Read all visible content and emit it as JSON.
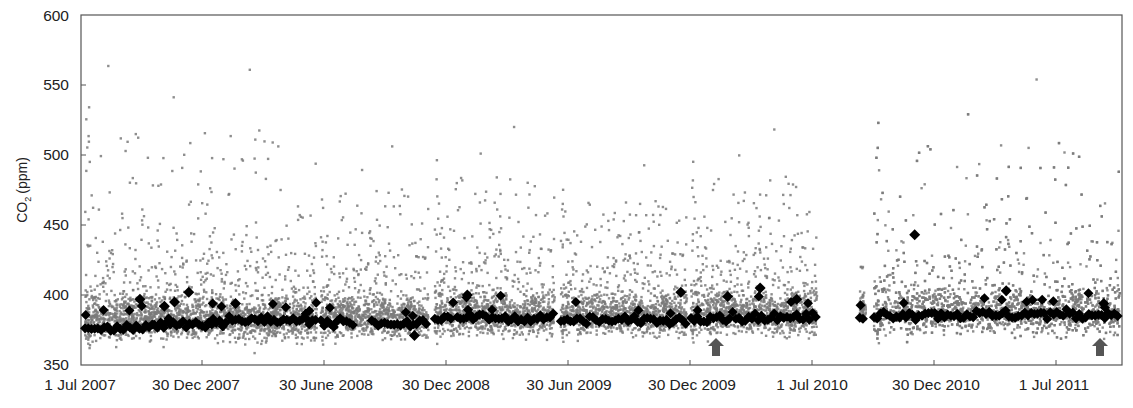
{
  "chart_data": {
    "type": "scatter",
    "title": "",
    "xlabel": "",
    "ylabel": "CO2 (ppm)",
    "ylabel_main": "CO",
    "ylabel_sub": "2",
    "ylabel_unit": "(ppm)",
    "ylim": [
      350,
      600
    ],
    "yticks": [
      350,
      400,
      450,
      500,
      550,
      600
    ],
    "ytick_labels": [
      "350",
      "400",
      "450",
      "500",
      "550",
      "600"
    ],
    "xlim": [
      "1 Jul 2007",
      "Oct 2011"
    ],
    "xtick_labels": [
      "1 Jul 2007",
      "30 Dec 2007",
      "30 June 2008",
      "30 Dec 2008",
      "30 Jun 2009",
      "30 Dec 2009",
      "1 Jul 2010",
      "30 Dec 2010",
      "1 Jul 2011"
    ],
    "grid": false,
    "legend": null,
    "series": [
      {
        "name": "Hourly CO2 observations",
        "marker": "small x / square",
        "color": "#7a7a7a",
        "description": "Dense band roughly 365-420 ppm with frequent upward spikes to 450-585 ppm; max about 585 ppm near Nov 2007; min about 353 ppm near Nov 2007",
        "segments": [
          {
            "start_month": 0.2,
            "end_month": 11.6,
            "base": 383,
            "spread": 14,
            "spike_max": 585
          },
          {
            "start_month": 11.8,
            "end_month": 17.1,
            "base": 384,
            "spread": 13,
            "spike_max": 515
          },
          {
            "start_month": 17.4,
            "end_month": 23.3,
            "base": 386,
            "spread": 14,
            "spike_max": 530
          },
          {
            "start_month": 23.6,
            "end_month": 29.8,
            "base": 386,
            "spread": 13,
            "spike_max": 500
          },
          {
            "start_month": 30.0,
            "end_month": 36.2,
            "base": 387,
            "spread": 14,
            "spike_max": 528
          },
          {
            "start_month": 38.3,
            "end_month": 38.6,
            "base": 390,
            "spread": 10,
            "spike_max": 420
          },
          {
            "start_month": 39.0,
            "end_month": 51.1,
            "base": 388,
            "spread": 15,
            "spike_max": 567
          }
        ],
        "approx_extremes": {
          "max": 585,
          "max_date": "Nov 2007",
          "min": 353,
          "min_date": "Nov 2007"
        }
      },
      {
        "name": "Baseline CO2",
        "marker": "diamond",
        "color": "#000000",
        "description": "Background baseline values, mostly 378-392 ppm, occasional values up to about 443 ppm",
        "x": [
          "Jul 2007",
          "Sep 2007",
          "Oct 2007",
          "Nov 2007",
          "Dec 2007",
          "Feb 2008",
          "Apr 2008",
          "Jun 2008",
          "Jul 2008",
          "Oct 2008",
          "Dec 2008",
          "Feb 2009",
          "May 2009",
          "Jul 2009",
          "Sep 2009",
          "Nov 2009",
          "Jan 2010",
          "Mar 2010",
          "May 2010",
          "Jun 2010",
          "Sep 2010",
          "Nov 2010",
          "Dec 2010",
          "Feb 2011",
          "Apr 2011",
          "Jun 2011",
          "Aug 2011",
          "Sep 2011"
        ],
        "values": [
          378,
          377,
          375,
          380,
          381,
          383,
          384,
          382,
          380,
          381,
          384,
          384,
          383,
          381,
          382,
          383,
          384,
          385,
          385,
          383,
          385,
          386,
          443,
          387,
          388,
          387,
          386,
          386
        ]
      }
    ],
    "annotations": [
      {
        "type": "arrow-up",
        "x": "Feb 2010",
        "y_px_hint": "near bottom axis",
        "color": "#555555"
      },
      {
        "type": "arrow-up",
        "x": "Sep 2011",
        "y_px_hint": "near bottom axis",
        "color": "#555555"
      }
    ],
    "data_gap": "About Jul 2010 - Sep 2010 (no observations)"
  },
  "style": {
    "raw_color": "#7a7a7a",
    "baseline_color": "#000000",
    "arrow_color": "#555555",
    "axis_color": "#444444"
  }
}
